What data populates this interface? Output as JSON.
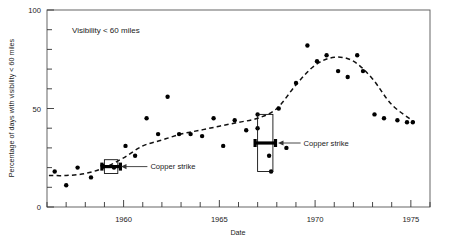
{
  "chart_data": {
    "type": "scatter",
    "title": "",
    "panel_note": "Visibility < 60 miles",
    "xlabel": "Date",
    "ylabel": "Percentage of days with visibility < 60 miles",
    "xlim": [
      1956,
      1976
    ],
    "ylim": [
      0,
      100
    ],
    "grid": false,
    "legend": null,
    "x_ticks_major": [
      1960,
      1965,
      1970,
      1975
    ],
    "x_tick_labels": [
      "1960",
      "1965",
      "1970",
      "1975"
    ],
    "x_ticks_minor_step": 1,
    "y_ticks_major": [
      0,
      50,
      100
    ],
    "y_tick_labels": [
      "0",
      "50",
      "100"
    ],
    "y_ticks_minor_step": 10,
    "series": [
      {
        "name": "Percentage of days with visibility < 60 miles",
        "marker": "filled-circle",
        "points": [
          {
            "x": 1956.4,
            "y": 18
          },
          {
            "x": 1957.0,
            "y": 11
          },
          {
            "x": 1957.6,
            "y": 20
          },
          {
            "x": 1958.3,
            "y": 15
          },
          {
            "x": 1958.9,
            "y": 21
          },
          {
            "x": 1959.5,
            "y": 20
          },
          {
            "x": 1960.1,
            "y": 31
          },
          {
            "x": 1960.6,
            "y": 26
          },
          {
            "x": 1961.2,
            "y": 45
          },
          {
            "x": 1961.8,
            "y": 37
          },
          {
            "x": 1962.3,
            "y": 56
          },
          {
            "x": 1962.9,
            "y": 37
          },
          {
            "x": 1963.5,
            "y": 37
          },
          {
            "x": 1964.1,
            "y": 36
          },
          {
            "x": 1964.7,
            "y": 45
          },
          {
            "x": 1965.2,
            "y": 31
          },
          {
            "x": 1965.8,
            "y": 44
          },
          {
            "x": 1966.4,
            "y": 39
          },
          {
            "x": 1967.0,
            "y": 40
          },
          {
            "x": 1967.0,
            "y": 47
          },
          {
            "x": 1967.6,
            "y": 26
          },
          {
            "x": 1967.7,
            "y": 18
          },
          {
            "x": 1968.1,
            "y": 50
          },
          {
            "x": 1968.5,
            "y": 30
          },
          {
            "x": 1969.0,
            "y": 63
          },
          {
            "x": 1969.6,
            "y": 82
          },
          {
            "x": 1970.1,
            "y": 74
          },
          {
            "x": 1970.6,
            "y": 77
          },
          {
            "x": 1971.2,
            "y": 69
          },
          {
            "x": 1971.7,
            "y": 66
          },
          {
            "x": 1972.2,
            "y": 77
          },
          {
            "x": 1972.5,
            "y": 69
          },
          {
            "x": 1973.1,
            "y": 47
          },
          {
            "x": 1973.6,
            "y": 45
          },
          {
            "x": 1974.3,
            "y": 44
          },
          {
            "x": 1974.8,
            "y": 43
          },
          {
            "x": 1975.1,
            "y": 43
          }
        ]
      }
    ],
    "trend_line": {
      "name": "smoothed trend",
      "style": "dashed",
      "points": [
        {
          "x": 1956.1,
          "y": 16
        },
        {
          "x": 1957.0,
          "y": 16
        },
        {
          "x": 1958.0,
          "y": 17
        },
        {
          "x": 1959.0,
          "y": 20
        },
        {
          "x": 1960.0,
          "y": 25
        },
        {
          "x": 1961.0,
          "y": 31
        },
        {
          "x": 1962.0,
          "y": 34
        },
        {
          "x": 1963.0,
          "y": 37
        },
        {
          "x": 1964.0,
          "y": 39
        },
        {
          "x": 1965.0,
          "y": 41
        },
        {
          "x": 1966.0,
          "y": 43
        },
        {
          "x": 1967.0,
          "y": 45
        },
        {
          "x": 1968.0,
          "y": 50
        },
        {
          "x": 1969.0,
          "y": 62
        },
        {
          "x": 1970.0,
          "y": 72
        },
        {
          "x": 1971.0,
          "y": 76
        },
        {
          "x": 1972.0,
          "y": 74
        },
        {
          "x": 1973.0,
          "y": 65
        },
        {
          "x": 1974.0,
          "y": 52
        },
        {
          "x": 1975.2,
          "y": 43
        }
      ]
    },
    "annotations": [
      {
        "label": "Copper strike",
        "marker": "boxed-error-bar",
        "box": {
          "x_start": 1959.0,
          "x_end": 1959.7,
          "y_start": 17,
          "y_end": 24
        },
        "leader_to": {
          "x": 1960.1,
          "y": 20
        },
        "text_at": {
          "x": 1961.4,
          "y": 20
        }
      },
      {
        "label": "Copper strike",
        "marker": "boxed-error-bar",
        "box": {
          "x_start": 1967.0,
          "x_end": 1967.8,
          "y_start": 18,
          "y_end": 47
        },
        "leader_to": {
          "x": 1968.3,
          "y": 31
        },
        "text_at": {
          "x": 1969.4,
          "y": 31
        }
      }
    ]
  }
}
